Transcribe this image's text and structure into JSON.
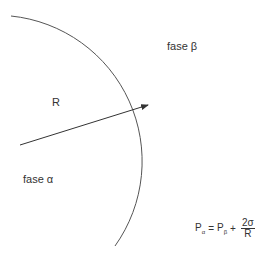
{
  "diagram": {
    "labels": {
      "phase_beta": "fase β",
      "phase_alpha": "fase α",
      "radius": "R"
    },
    "formula": {
      "lhs_symbol": "P",
      "lhs_sub": "α",
      "equals": "=",
      "rhs_symbol": "P",
      "rhs_sub": "β",
      "plus": "+",
      "numerator": "2σ",
      "denominator": "R"
    },
    "colors": {
      "line": "#333333",
      "text": "#333333",
      "background": "#ffffff"
    }
  }
}
